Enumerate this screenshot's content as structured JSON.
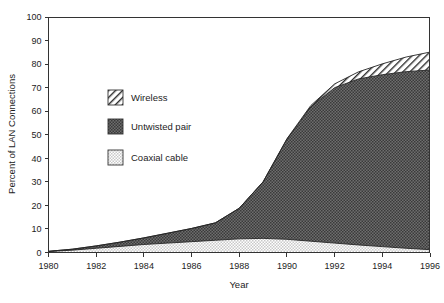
{
  "chart_data": {
    "type": "area",
    "stacked": true,
    "title": "",
    "xlabel": "Year",
    "ylabel": "Percent of LAN Connections",
    "xlim": [
      1980,
      1996
    ],
    "ylim": [
      0,
      100
    ],
    "ytick_step": 10,
    "xtick_step": 2,
    "grid": false,
    "legend_position": "inside-upper-left",
    "xticks": [
      "1980",
      "1982",
      "1984",
      "1986",
      "1988",
      "1990",
      "1992",
      "1994",
      "1996"
    ],
    "yticks": [
      "0",
      "10",
      "20",
      "30",
      "40",
      "50",
      "60",
      "70",
      "80",
      "90",
      "100"
    ],
    "x": [
      1980,
      1981,
      1982,
      1983,
      1984,
      1985,
      1986,
      1987,
      1988,
      1989,
      1990,
      1991,
      1992,
      1993,
      1994,
      1995,
      1996
    ],
    "series": [
      {
        "name": "Coaxial cable",
        "fill": "fine-dot-hatch",
        "color": "#d8d8d8",
        "values": [
          0.4,
          1.0,
          1.8,
          2.6,
          3.4,
          4.0,
          4.6,
          5.2,
          5.8,
          6.0,
          5.6,
          4.8,
          4.0,
          3.2,
          2.5,
          1.8,
          1.2
        ]
      },
      {
        "name": "Untwisted pair",
        "fill": "dark-cross-hatch",
        "color": "#595959",
        "values": [
          0.1,
          0.4,
          1.0,
          1.8,
          2.8,
          4.2,
          5.6,
          7.4,
          13.0,
          24.0,
          42.5,
          57.0,
          66.0,
          70.5,
          73.0,
          75.0,
          76.3
        ]
      },
      {
        "name": "Wireless",
        "fill": "diagonal-hatch",
        "color": "#ffffff",
        "values": [
          0.0,
          0.0,
          0.0,
          0.0,
          0.0,
          0.0,
          0.0,
          0.0,
          0.0,
          0.0,
          0.2,
          0.6,
          1.6,
          3.0,
          4.6,
          6.2,
          7.6
        ]
      }
    ],
    "cumulative_top": [
      0.5,
      1.4,
      2.8,
      4.4,
      6.2,
      8.2,
      10.2,
      12.6,
      18.8,
      30.0,
      48.3,
      62.4,
      71.6,
      76.7,
      80.1,
      83.0,
      85.1
    ]
  },
  "legend": {
    "items": [
      {
        "label": "Wireless",
        "swatch": "diagonal-hatch"
      },
      {
        "label": "Untwisted pair",
        "swatch": "dark-cross-hatch"
      },
      {
        "label": "Coaxial cable",
        "swatch": "fine-dot-hatch"
      }
    ]
  },
  "axes": {
    "y_title": "Percent of LAN Connections",
    "x_title": "Year"
  }
}
